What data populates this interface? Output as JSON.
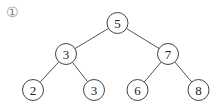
{
  "figure": {
    "label": "①",
    "edge_color": "#555555",
    "node_stroke": "#444444",
    "node_fill": "#ffffff",
    "text_color": "#222222",
    "node_radius": 10.5
  },
  "tree": {
    "nodes": [
      {
        "id": "n1",
        "value": "5",
        "x": 117.5,
        "y": 23,
        "level": 0
      },
      {
        "id": "n2",
        "value": "3",
        "x": 66,
        "y": 54,
        "level": 1
      },
      {
        "id": "n3",
        "value": "7",
        "x": 168,
        "y": 54,
        "level": 1
      },
      {
        "id": "n4",
        "value": "2",
        "x": 33,
        "y": 90,
        "level": 2
      },
      {
        "id": "n5",
        "value": "3",
        "x": 94,
        "y": 90,
        "level": 2
      },
      {
        "id": "n6",
        "value": "6",
        "x": 137.5,
        "y": 90,
        "level": 2
      },
      {
        "id": "n7",
        "value": "8",
        "x": 198.5,
        "y": 90,
        "level": 2
      }
    ],
    "edges": [
      {
        "from": "n1",
        "to": "n2"
      },
      {
        "from": "n1",
        "to": "n3"
      },
      {
        "from": "n2",
        "to": "n4"
      },
      {
        "from": "n2",
        "to": "n5"
      },
      {
        "from": "n3",
        "to": "n6"
      },
      {
        "from": "n3",
        "to": "n7"
      }
    ]
  }
}
